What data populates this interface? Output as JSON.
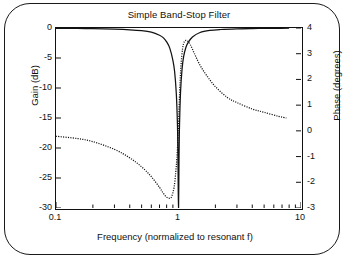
{
  "chart_data": {
    "type": "line",
    "title": "Simple Band-Stop Filter",
    "xlabel": "Frequency (normalized to resonant f)",
    "ylabel": "Gain (dB)",
    "y2label": "Phase (degrees)",
    "xscale": "log",
    "xlim": [
      0.1,
      10
    ],
    "ylim": [
      -30,
      0
    ],
    "y2lim": [
      -3,
      4
    ],
    "grid": false,
    "legend": "none",
    "xticks": [
      "0.1",
      "1",
      "10"
    ],
    "xtick_values": [
      0.1,
      1,
      10
    ],
    "yticks": [
      "0",
      "-5",
      "-10",
      "-15",
      "-20",
      "-25",
      "-30"
    ],
    "ytick_values": [
      0,
      -5,
      -10,
      -15,
      -20,
      -25,
      -30
    ],
    "y2ticks": [
      "4",
      "3",
      "2",
      "1",
      "0",
      "-1",
      "-2",
      "-3"
    ],
    "y2tick_values": [
      4,
      3,
      2,
      1,
      0,
      -1,
      -2,
      -3
    ],
    "series": [
      {
        "name": "Gain",
        "style": "solid",
        "axis": "left",
        "units": "dB",
        "x": [
          0.1,
          0.15,
          0.2,
          0.3,
          0.4,
          0.5,
          0.6,
          0.7,
          0.75,
          0.8,
          0.85,
          0.9,
          0.93,
          0.96,
          0.98,
          0.99,
          1.0,
          1.01,
          1.02,
          1.04,
          1.07,
          1.1,
          1.15,
          1.2,
          1.3,
          1.5,
          1.8,
          2.2,
          3.0,
          4.0,
          5.0,
          6.5,
          8.0
        ],
        "values": [
          -0.05,
          -0.08,
          -0.12,
          -0.2,
          -0.3,
          -0.45,
          -0.7,
          -1.2,
          -1.6,
          -2.3,
          -3.4,
          -5.4,
          -7.3,
          -11.0,
          -16.0,
          -21.5,
          -31.0,
          -21.5,
          -16.0,
          -10.5,
          -6.8,
          -4.8,
          -3.2,
          -2.4,
          -1.5,
          -0.75,
          -0.4,
          -0.25,
          -0.14,
          -0.09,
          -0.07,
          -0.05,
          -0.04
        ]
      },
      {
        "name": "Phase",
        "style": "dotted",
        "axis": "right",
        "units": "degrees",
        "x": [
          0.1,
          0.15,
          0.2,
          0.3,
          0.4,
          0.5,
          0.6,
          0.7,
          0.75,
          0.8,
          0.85,
          0.88,
          0.92,
          0.95,
          0.97,
          0.99,
          1.0,
          1.01,
          1.03,
          1.05,
          1.08,
          1.12,
          1.18,
          1.25,
          1.35,
          1.5,
          1.7,
          2.0,
          2.5,
          3.0,
          4.0,
          5.0,
          6.5,
          7.6
        ],
        "values": [
          -0.21,
          -0.3,
          -0.42,
          -0.72,
          -1.05,
          -1.4,
          -1.78,
          -2.2,
          -2.42,
          -2.58,
          -2.62,
          -2.55,
          -2.2,
          -1.6,
          -1.05,
          -0.3,
          0.2,
          0.85,
          1.9,
          2.6,
          3.2,
          3.48,
          3.5,
          3.35,
          3.0,
          2.55,
          2.15,
          1.72,
          1.3,
          1.1,
          0.85,
          0.72,
          0.57,
          0.5
        ]
      }
    ],
    "annotations": []
  },
  "figure": {
    "border_shape": "rounded-rectangle",
    "background": "#ffffff",
    "line_color": "#111111"
  }
}
